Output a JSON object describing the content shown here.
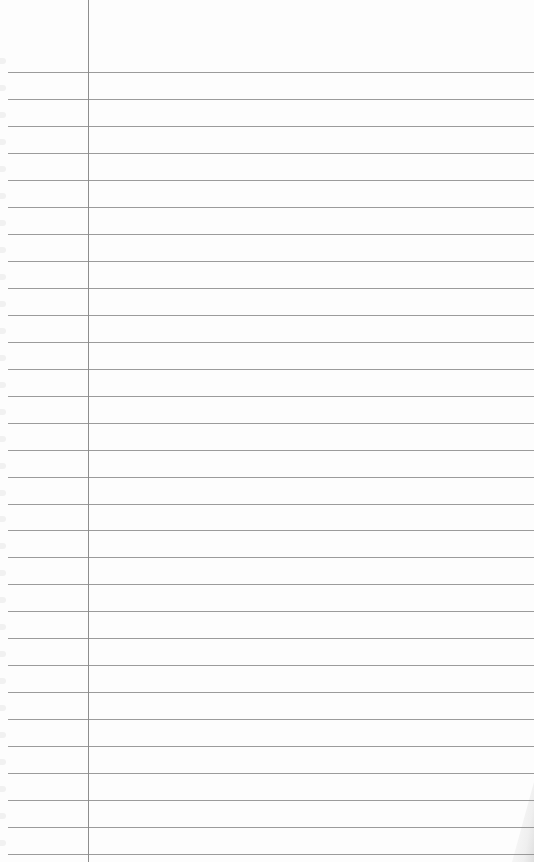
{
  "page": {
    "type": "lined-notebook-paper",
    "width": 534,
    "height": 862,
    "background_color": "#fdfdfd",
    "rule_color": "#8a8a8a",
    "margin_color": "#7a7a7a",
    "margin_x": 88,
    "first_rule_y": 72,
    "rule_spacing": 26.97,
    "rule_count": 30,
    "rule_start_x": 8,
    "text_content": []
  }
}
